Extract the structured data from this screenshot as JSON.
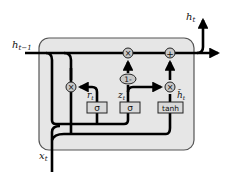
{
  "diagram": {
    "type": "GRU cell",
    "colors": {
      "cell_fill": "#e6e6e6",
      "cell_border": "#555555",
      "wire": "#000000",
      "operator_fill": "#c8c8c8",
      "gate_fill": "#d9d9d9"
    },
    "labels": {
      "h_prev": {
        "main": "h",
        "sub": "t−1"
      },
      "h_out": {
        "main": "h",
        "sub": "t"
      },
      "x_in": {
        "main": "x",
        "sub": "t"
      },
      "r_gate": {
        "main": "r",
        "sub": "t"
      },
      "z_gate": {
        "main": "z",
        "sub": "t"
      },
      "h_tilde": {
        "main": "h̃",
        "sub": "t"
      }
    },
    "gates": {
      "reset_sigma": "σ",
      "update_sigma": "σ",
      "candidate_tanh": "tanh"
    },
    "operators": {
      "reset_multiply": "×",
      "keep_multiply": "×",
      "candidate_multiply": "×",
      "add": "+",
      "one_minus": "1-"
    }
  }
}
